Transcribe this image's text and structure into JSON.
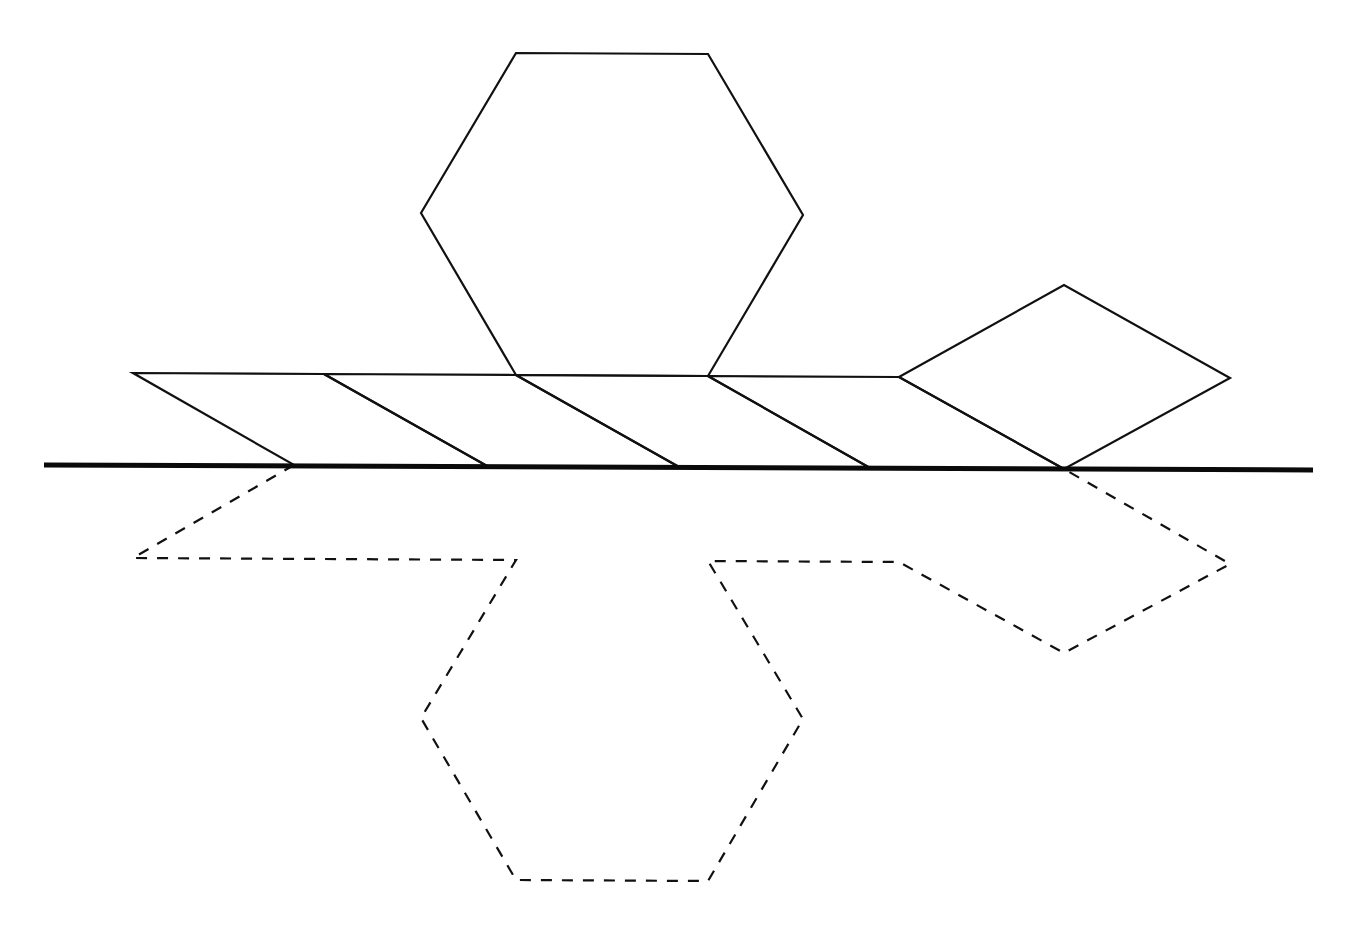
{
  "diagram": {
    "title": "",
    "colors": {
      "stroke": "#111111",
      "mirror": "#0a0a0a",
      "background": "#ffffff"
    },
    "mirror_line": {
      "x1": 44,
      "y1": 465,
      "x2": 1313,
      "y2": 470
    },
    "hexagon": {
      "points": "516,53 708,54 803,215 708,376 516,375 421,213"
    },
    "strip": {
      "top_edge": "133,373 324,374 516,375 708,376 899,377",
      "parallelograms": [
        {
          "points": "133,373 324,374 487,466 294,465"
        },
        {
          "points": "324,374 516,375 679,467 487,466"
        },
        {
          "points": "516,375 708,376 870,468 679,467"
        },
        {
          "points": "708,376 899,377 1064,469 870,468"
        }
      ]
    },
    "rhombus": {
      "points": "899,377 1064,285 1230,378 1064,469"
    },
    "reflection": {
      "points": "294,465 133,558 516,560 421,718 516,880 708,881 803,719 708,561 899,562 1064,653 1230,564 1064,469"
    }
  }
}
